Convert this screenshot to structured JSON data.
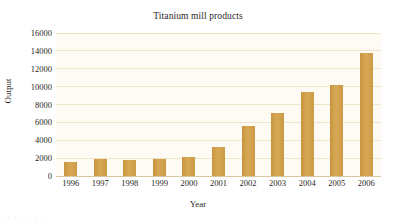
{
  "chart_data": {
    "type": "bar",
    "title": "Titanium mill products",
    "xlabel": "Year",
    "ylabel": "Output",
    "categories": [
      "1996",
      "1997",
      "1998",
      "1999",
      "2000",
      "2001",
      "2002",
      "2003",
      "2004",
      "2005",
      "2006"
    ],
    "values": [
      1600,
      1850,
      1830,
      1870,
      2100,
      3200,
      5600,
      7100,
      9400,
      10200,
      13800
    ],
    "ylim": [
      0,
      16000
    ],
    "ytick_labels": [
      "0",
      "2000",
      "4000",
      "6000",
      "8000",
      "10000",
      "12000",
      "14000",
      "16000"
    ],
    "ytick_values": [
      0,
      2000,
      4000,
      6000,
      8000,
      10000,
      12000,
      14000,
      16000
    ],
    "grid": true,
    "legend": "none",
    "series_name": "Output",
    "colors": {
      "bar": "#d4a24c",
      "gridline": "#efe3c8",
      "plot_background": "#fdfbf3",
      "page_background": "#ffffff",
      "text": "#2b2724"
    }
  },
  "footer": {
    "bleed_text": "· · · · · · ·"
  }
}
